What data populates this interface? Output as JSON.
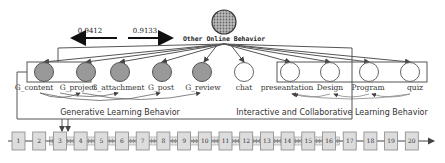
{
  "diagram": {
    "top_node": {
      "label": "Other Online Behavior"
    },
    "weights": {
      "left": "0.9412",
      "right": "0.9133"
    },
    "generative_nodes": [
      {
        "label": "G_content",
        "x": 44
      },
      {
        "label": "G_project",
        "x": 86
      },
      {
        "label": "G_attachment",
        "x": 120
      },
      {
        "label": "G_post",
        "x": 162
      },
      {
        "label": "G_review",
        "x": 202
      }
    ],
    "chat_node": {
      "label": "chat",
      "x": 244
    },
    "interactive_nodes": [
      {
        "label": "preseantation",
        "x": 290
      },
      {
        "label": "Design",
        "x": 330
      },
      {
        "label": "Program",
        "x": 369
      },
      {
        "label": "quiz",
        "x": 410
      }
    ],
    "sections": {
      "generative": "Generative Learning Behavior",
      "interactive": "Interactive and Collaborative Learning Behavior"
    },
    "timeline": [
      "1",
      "2",
      "3",
      "4",
      "5",
      "6",
      "7",
      "8",
      "9",
      "10",
      "11",
      "12",
      "13",
      "14",
      "15",
      "16",
      "17",
      "18",
      "19",
      "20"
    ]
  },
  "colors": {
    "filled_node": "#999999",
    "box_fill": "#dddddd",
    "stroke": "#555555"
  }
}
